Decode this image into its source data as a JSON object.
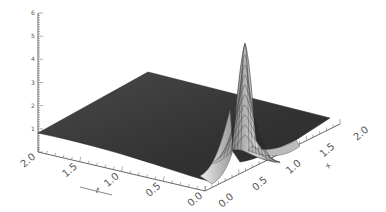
{
  "chart_data": {
    "type": "surface3d",
    "title": "",
    "axes": {
      "z": {
        "label": "",
        "ticks": [
          "0",
          "1",
          "2",
          "3",
          "4",
          "5",
          "6"
        ],
        "range": [
          0,
          6
        ]
      },
      "left": {
        "label": "t",
        "ticks": [
          "2.0",
          "1.5",
          "1.0",
          "0.5",
          "0.0"
        ],
        "range": [
          0,
          2
        ]
      },
      "right": {
        "label": "x",
        "ticks": [
          "0.0",
          "0.5",
          "1.0",
          "1.5",
          "2.0"
        ],
        "range": [
          0,
          2
        ]
      }
    },
    "surface": {
      "description": "Dark shaded surface sloping gently from ~0.8 at back-left corner; sharp Gaussian-like peak near origin reaching ~5 along the 'x' edge, with a dip (negative lobe) on one side",
      "baseline_height": 0.8,
      "peak_height": 5.0,
      "peak_location": {
        "t": 0.0,
        "x": 0.0
      },
      "color_dark": "#3a3a3a",
      "color_light": "#bcbcbc"
    },
    "grid": false,
    "legend": null
  }
}
